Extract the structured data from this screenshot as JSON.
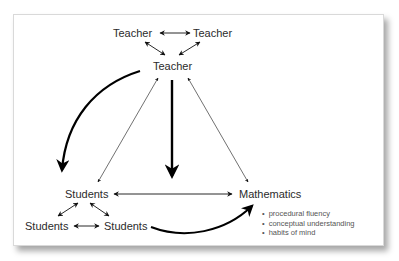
{
  "diagram": {
    "nodes": {
      "teacher_left": "Teacher",
      "teacher_right": "Teacher",
      "teacher_center": "Teacher",
      "students_main": "Students",
      "students_left": "Students",
      "students_right": "Students",
      "mathematics": "Mathematics"
    },
    "mathematics_bullets": [
      "procedural fluency",
      "conceptual understanding",
      "habits of mind"
    ],
    "edges": [
      {
        "from": "teacher_left",
        "to": "teacher_right",
        "type": "double-thin"
      },
      {
        "from": "teacher_left",
        "to": "teacher_center",
        "type": "double-thin"
      },
      {
        "from": "teacher_right",
        "to": "teacher_center",
        "type": "double-thin"
      },
      {
        "from": "teacher_center",
        "to": "students_main",
        "type": "double-thin"
      },
      {
        "from": "teacher_center",
        "to": "mathematics",
        "type": "double-thin"
      },
      {
        "from": "teacher_center",
        "to": "students_main",
        "type": "curved-thick"
      },
      {
        "from": "teacher_center",
        "to": "between students/mathematics",
        "type": "straight-thick"
      },
      {
        "from": "students_main",
        "to": "mathematics",
        "type": "double-thin"
      },
      {
        "from": "students_main",
        "to": "students_left",
        "type": "double-thin"
      },
      {
        "from": "students_main",
        "to": "students_right",
        "type": "double-thin"
      },
      {
        "from": "students_left",
        "to": "students_right",
        "type": "double-thin"
      },
      {
        "from": "students_right",
        "to": "mathematics",
        "type": "curved-thick"
      }
    ],
    "colors": {
      "text": "#2b2b2b",
      "line": "#111111",
      "bullet_text": "#555555"
    }
  }
}
